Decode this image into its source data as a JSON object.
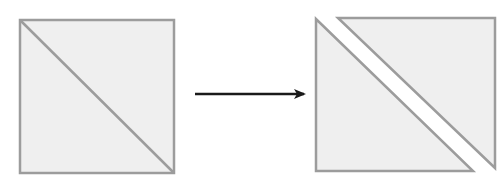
{
  "diagram": {
    "colors": {
      "fill": "#efefef",
      "stroke": "#9c9c9c",
      "arrow": "#1a1a1a",
      "background": "#ffffff"
    },
    "before": {
      "label": "square with diagonal",
      "square": {
        "x": 20,
        "y": 20,
        "size": 154
      },
      "diagonal": {
        "x1": 20,
        "y1": 20,
        "x2": 174,
        "y2": 173
      }
    },
    "arrow": {
      "x1": 195,
      "y1": 94,
      "x2": 304,
      "y2": 94,
      "label": "transforms into"
    },
    "after": {
      "label": "two separated triangles",
      "lower_left_triangle": {
        "points": "316,19 316,171 473,171"
      },
      "upper_right_triangle": {
        "points": "338,18 495,18 495,168"
      }
    }
  }
}
